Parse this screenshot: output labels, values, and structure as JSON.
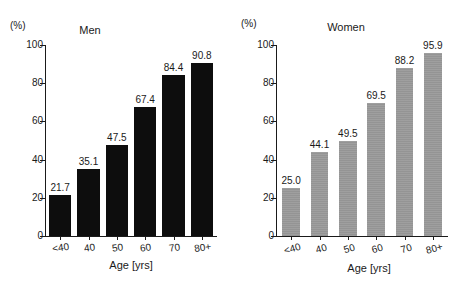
{
  "figure": {
    "width": 458,
    "height": 287,
    "background": "#ffffff"
  },
  "chart_data": [
    {
      "type": "bar",
      "title": "Men",
      "unit_label": "(%)",
      "xlabel": "Age [yrs]",
      "ylabel": "",
      "categories": [
        "<40",
        "40",
        "50",
        "60",
        "70",
        "80+"
      ],
      "values": [
        21.7,
        35.1,
        47.5,
        67.4,
        84.4,
        90.8
      ],
      "value_labels": [
        "21.7",
        "35.1",
        "47.5",
        "67.4",
        "84.4",
        "90.8"
      ],
      "ylim": [
        0,
        100
      ],
      "yticks": [
        0,
        20,
        40,
        60,
        80,
        100
      ],
      "ytick_labels": [
        "0",
        "20",
        "40",
        "60",
        "80",
        "100"
      ],
      "grid": false,
      "legend": "none",
      "bar_color": "#0d0d0d"
    },
    {
      "type": "bar",
      "title": "Women",
      "unit_label": "(%)",
      "xlabel": "Age [yrs]",
      "ylabel": "",
      "categories": [
        "<40",
        "40",
        "50",
        "60",
        "70",
        "80+"
      ],
      "values": [
        25.0,
        44.1,
        49.5,
        69.5,
        88.2,
        95.9
      ],
      "value_labels": [
        "25.0",
        "44.1",
        "49.5",
        "69.5",
        "88.2",
        "95.9"
      ],
      "ylim": [
        0,
        100
      ],
      "yticks": [
        0,
        20,
        40,
        60,
        80,
        100
      ],
      "ytick_labels": [
        "0",
        "20",
        "40",
        "60",
        "80",
        "100"
      ],
      "grid": false,
      "legend": "none",
      "bar_color": "#949494"
    }
  ]
}
